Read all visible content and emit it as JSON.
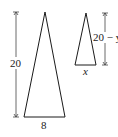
{
  "diagram": {
    "large_triangle": {
      "height_label": "20",
      "base_label": "8"
    },
    "small_triangle": {
      "height_label": "20 − y",
      "base_label": "x"
    },
    "colors": {
      "stroke": "#1a1a1a",
      "text": "#222222"
    }
  }
}
